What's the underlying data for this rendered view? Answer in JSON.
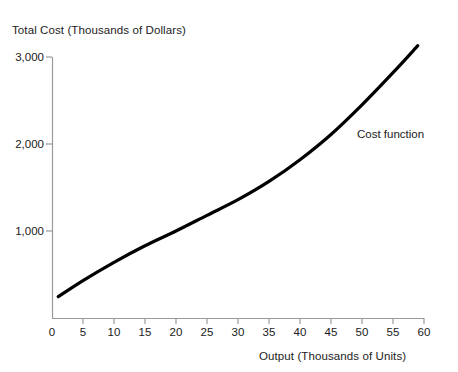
{
  "chart_data": {
    "type": "line",
    "title": "",
    "xlabel": "Output (Thousands of Units)",
    "ylabel": "Total Cost (Thousands of Dollars)",
    "xlim": [
      0,
      60
    ],
    "ylim": [
      0,
      3200
    ],
    "grid": false,
    "legend_position": "inline-annotation",
    "xticks": [
      "0",
      "5",
      "10",
      "15",
      "20",
      "25",
      "30",
      "35",
      "40",
      "45",
      "50",
      "55",
      "60"
    ],
    "xtick_values": [
      0,
      5,
      10,
      15,
      20,
      25,
      30,
      35,
      40,
      45,
      50,
      55,
      60
    ],
    "yticks": [
      "1,000",
      "2,000",
      "3,000"
    ],
    "ytick_values": [
      1000,
      2000,
      3000
    ],
    "series": [
      {
        "name": "Cost function",
        "color": "#000000",
        "x": [
          1,
          5,
          10,
          15,
          20,
          25,
          30,
          35,
          40,
          45,
          50,
          55,
          59
        ],
        "values": [
          245,
          430,
          640,
          830,
          1000,
          1180,
          1360,
          1570,
          1820,
          2110,
          2450,
          2820,
          3130
        ]
      }
    ],
    "annotations": [
      {
        "text": "Cost function",
        "x": 48,
        "y": 2130
      }
    ]
  },
  "axes": {
    "x_label": "Output (Thousands of Units)",
    "y_label": "Total Cost (Thousands of Dollars)"
  }
}
